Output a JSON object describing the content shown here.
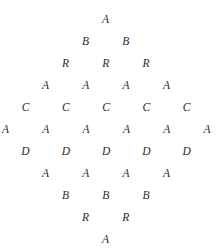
{
  "figure": {
    "name": "letter-lattice",
    "width": 221,
    "height": 250,
    "background_color": "#ffffff",
    "glyph_color": "#2b2b2b",
    "column_pitch_px": 40.3,
    "row_pitch_px": 22,
    "origin_x": 105.5,
    "origin_y": 14,
    "rows": [
      {
        "index": 1,
        "letters": [
          "A"
        ],
        "y": 14,
        "x_start": 105.5
      },
      {
        "index": 2,
        "letters": [
          "B",
          "B"
        ],
        "y": 36,
        "x_start": 85.5
      },
      {
        "index": 3,
        "letters": [
          "R",
          "R",
          "R"
        ],
        "y": 58,
        "x_start": 65.5
      },
      {
        "index": 4,
        "letters": [
          "A",
          "A",
          "A",
          "A"
        ],
        "y": 80,
        "x_start": 45.5
      },
      {
        "index": 5,
        "letters": [
          "C",
          "C",
          "C",
          "C",
          "C"
        ],
        "y": 102,
        "x_start": 25.5
      },
      {
        "index": 6,
        "letters": [
          "A",
          "A",
          "A",
          "A",
          "A",
          "A"
        ],
        "y": 124,
        "x_start": 5.5
      },
      {
        "index": 7,
        "letters": [
          "D",
          "D",
          "D",
          "D",
          "D"
        ],
        "y": 146,
        "x_start": 25.5
      },
      {
        "index": 8,
        "letters": [
          "A",
          "A",
          "A",
          "A"
        ],
        "y": 168,
        "x_start": 45.5
      },
      {
        "index": 9,
        "letters": [
          "B",
          "B",
          "B"
        ],
        "y": 190,
        "x_start": 65.5
      },
      {
        "index": 10,
        "letters": [
          "R",
          "R"
        ],
        "y": 212,
        "x_start": 85.5
      },
      {
        "index": 11,
        "letters": [
          "A"
        ],
        "y": 234,
        "x_start": 105.5
      }
    ]
  }
}
